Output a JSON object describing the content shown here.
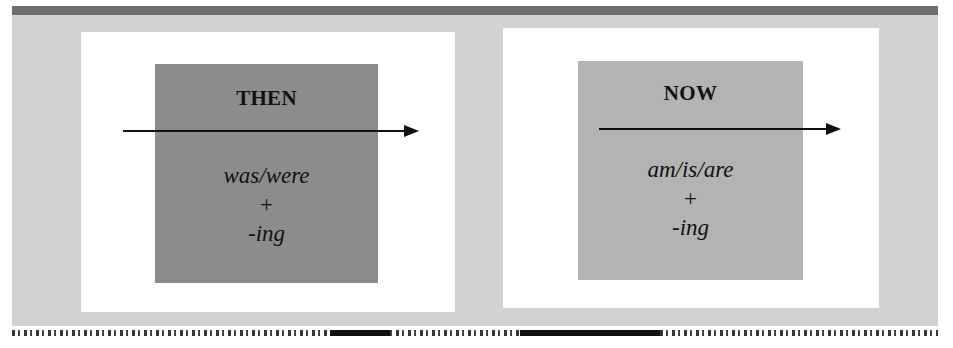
{
  "figure": {
    "colors": {
      "background": "#d2d2d2",
      "top_band": "#6e6e6e",
      "panel": "#ffffff",
      "then_square": "#8c8c8c",
      "now_square": "#b3b3b3",
      "text": "#111111"
    },
    "panels": [
      {
        "heading": "THEN",
        "line1": "was/were",
        "line2": "+",
        "line3": "-ing"
      },
      {
        "heading": "NOW",
        "line1": "am/is/are",
        "line2": "+",
        "line3": "-ing"
      }
    ]
  }
}
